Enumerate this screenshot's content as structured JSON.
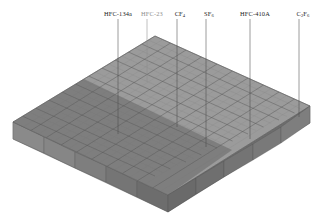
{
  "figure": {
    "type": "3d-bar-chart",
    "background_color": "#ffffff",
    "width": 322,
    "height": 224
  },
  "annotations": [
    {
      "id": "hfc-134a",
      "label": "HFC-134a",
      "label_plain": "HFC-134a",
      "x": 118,
      "y": 10,
      "line_x": 118,
      "line_y0": 19,
      "line_y1": 134,
      "faint": false
    },
    {
      "id": "hfc-23",
      "label": "HFC-23",
      "label_plain": "HFC-23",
      "x": 152,
      "y": 10,
      "line_x": 147,
      "line_y0": 19,
      "line_y1": 82,
      "faint": true
    },
    {
      "id": "cf4",
      "label": "CF",
      "sub": "4",
      "x": 180,
      "y": 10,
      "line_x": 177,
      "line_y0": 19,
      "line_y1": 127,
      "faint": false
    },
    {
      "id": "sf6",
      "label": "SF",
      "sub": "6",
      "x": 209,
      "y": 10,
      "line_x": 206,
      "line_y0": 19,
      "line_y1": 147,
      "faint": false
    },
    {
      "id": "hfc-410a",
      "label": "HFC-410A",
      "label_plain": "HFC-410A",
      "x": 255,
      "y": 10,
      "line_x": 250,
      "line_y0": 19,
      "line_y1": 139,
      "faint": false
    },
    {
      "id": "c2f6",
      "label": "C",
      "sub": "2",
      "label2": "F",
      "sub2": "6",
      "x": 303,
      "y": 10,
      "line_x": 299,
      "line_y0": 19,
      "line_y1": 117,
      "faint": false
    }
  ],
  "colors": {
    "top_light": "#9a9a9a",
    "top_dark": "#7b7b7b",
    "side_left": "#8a8a8a",
    "side_right": "#6f6f6f",
    "front_light": "#8f8f8f",
    "front_dark": "#6a6a6a",
    "grid_line": "#5a5a5a",
    "leader_line": "#4b4b4b",
    "label_text": "#1c1c1c",
    "label_faint": "#8e8e8e"
  },
  "chart_data": {
    "type": "bar",
    "title": "",
    "xlabel": "",
    "ylabel": "",
    "zlabel": "",
    "projection": "isometric-3d",
    "grid": true,
    "legend": null,
    "categories": [
      "HFC-134a",
      "HFC-23",
      "CF4",
      "SF6",
      "HFC-410A",
      "C2F6"
    ],
    "grid_cols": 10,
    "grid_rows": 10,
    "bar_uniform_height": 1,
    "values": [
      1,
      1,
      1,
      1,
      1,
      1
    ],
    "note": "Uniform-height 3D bar lattice (10 x 10 cells); a darker-shaded quadrant covers the lower-right region of the surface; six species are called out with vertical leader lines."
  }
}
